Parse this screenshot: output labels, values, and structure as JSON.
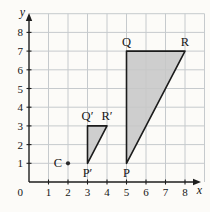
{
  "figure": {
    "axes": {
      "x_label": "x",
      "y_label": "y",
      "origin_label": "0",
      "x_ticks": [
        "1",
        "2",
        "3",
        "4",
        "5",
        "6",
        "7",
        "8"
      ],
      "y_ticks": [
        "1",
        "2",
        "3",
        "4",
        "5",
        "6",
        "7",
        "8"
      ],
      "x_range": [
        0,
        9
      ],
      "y_range": [
        0,
        9
      ],
      "grid": true
    },
    "shapes": [
      {
        "name": "triangle-PQR",
        "type": "polygon",
        "vertices": [
          [
            5,
            1
          ],
          [
            5,
            7
          ],
          [
            8,
            7
          ]
        ],
        "vertex_labels": [
          {
            "text": "P",
            "x": 5,
            "y": 1,
            "position": "below"
          },
          {
            "text": "Q",
            "x": 5,
            "y": 7,
            "position": "above"
          },
          {
            "text": "R",
            "x": 8,
            "y": 7,
            "position": "above"
          }
        ]
      },
      {
        "name": "triangle-P'Q'R'",
        "type": "polygon",
        "vertices": [
          [
            3,
            1
          ],
          [
            3,
            3
          ],
          [
            4,
            3
          ]
        ],
        "vertex_labels": [
          {
            "text": "P′",
            "x": 3,
            "y": 1,
            "position": "below"
          },
          {
            "text": "Q′",
            "x": 3,
            "y": 3,
            "position": "above"
          },
          {
            "text": "R′",
            "x": 4,
            "y": 3,
            "position": "above"
          }
        ]
      }
    ],
    "points": [
      {
        "text": "C",
        "x": 2,
        "y": 1,
        "position": "left"
      }
    ],
    "colors": {
      "background": "#fcfbf8",
      "grid": "#c6cacd",
      "axis": "#1e1e1e",
      "triangle_fill": "#c7c7c7",
      "triangle_outline": "#1b1b1b",
      "point": "#2a2a2a",
      "label": "#151515"
    }
  }
}
